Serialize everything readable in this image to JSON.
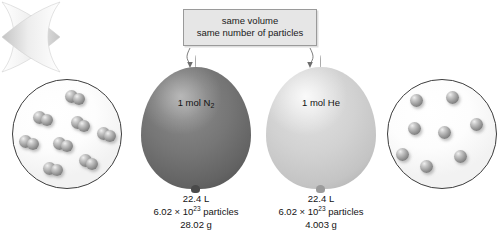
{
  "diagram": {
    "callout": {
      "line1": "same volume",
      "line2": "same number of particles"
    },
    "colors": {
      "nitrogen_balloon": "#707070",
      "helium_balloon": "#c8c8c8",
      "callout_background": "#e6e6e6",
      "callout_border": "#9a9a9a",
      "outline": "#3d3d3d",
      "text": "#141414"
    },
    "samples": [
      {
        "id": "nitrogen",
        "balloon_label_text": "1 mol N",
        "balloon_label_sub": "2",
        "particle_type": "diatomic",
        "particle_count": 8,
        "volume": "22.4 L",
        "particles_mantissa": "6.02 × 10",
        "particles_exponent": "23",
        "particles_unit": " particles",
        "mass": "28.02 g"
      },
      {
        "id": "helium",
        "balloon_label_text": "1 mol He",
        "balloon_label_sub": "",
        "particle_type": "monatomic",
        "particle_count": 8,
        "volume": "22.4 L",
        "particles_mantissa": "6.02 × 10",
        "particles_exponent": "23",
        "particles_unit": " particles",
        "mass": "4.003 g"
      }
    ]
  }
}
